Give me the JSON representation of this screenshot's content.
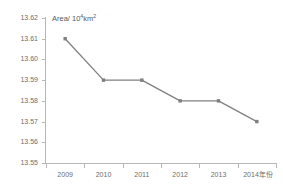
{
  "chart_data": {
    "type": "line",
    "title": "",
    "subtitle": "",
    "caption": "Area/ 10",
    "caption_exponent": "4",
    "caption_tail": "km",
    "caption_tail_exponent": "2",
    "xlabel": "",
    "ylabel": "Area/ 10⁴km²",
    "x_unit_label": "年份",
    "categories": [
      "2009",
      "2010",
      "2011",
      "2012",
      "2013",
      "2014"
    ],
    "x_tick_labels": [
      "2009",
      "2010",
      "2011",
      "2012",
      "2013",
      "2014年份"
    ],
    "values": [
      13.61,
      13.59,
      13.59,
      13.58,
      13.58,
      13.57
    ],
    "series": [
      {
        "name": "Area",
        "values": [
          13.61,
          13.59,
          13.59,
          13.58,
          13.58,
          13.57
        ]
      }
    ],
    "ylim": [
      13.55,
      13.62
    ],
    "y_tick_labels": [
      "13.62",
      "13.61",
      "13.60",
      "13.59",
      "13.58",
      "13.57",
      "13.56",
      "13.55"
    ],
    "y_ticks": [
      13.62,
      13.61,
      13.6,
      13.59,
      13.58,
      13.57,
      13.56,
      13.55
    ],
    "grid": false,
    "legend": false,
    "legend_position": "none",
    "line_color": "#808080",
    "marker_color": "#7f7f7f",
    "marker_shape": "square",
    "axis_color": "#b7b7b7",
    "text_color": "#6e6e6e",
    "background": "#ffffff"
  }
}
